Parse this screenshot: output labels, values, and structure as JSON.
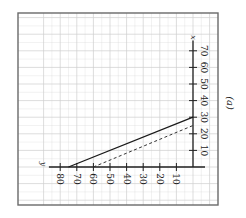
{
  "figure": {
    "panel_label": "(a)",
    "rotation_deg": 90,
    "colors": {
      "frame": "#6a6a6a",
      "grid": "#cfcfcf",
      "axis": "#222222",
      "solid_line": "#1a1a1a",
      "dashed_line": "#333333",
      "background": "#ffffff"
    }
  },
  "chart_data": {
    "type": "line",
    "title": "",
    "panel_label": "(a)",
    "xlabel": "x",
    "ylabel": "y",
    "orientation_note": "figure printed rotated 90 degrees clockwise; x axis runs up the page on the right, y axis runs left along the bottom",
    "xlim": [
      0,
      75
    ],
    "ylim": [
      0,
      85
    ],
    "x_ticks": [
      10,
      20,
      30,
      40,
      50,
      60,
      70
    ],
    "y_ticks": [
      10,
      20,
      30,
      40,
      50,
      60,
      70,
      80
    ],
    "grid": true,
    "legend": null,
    "series": [
      {
        "name": "solid",
        "style": "solid",
        "points": [
          {
            "x": 0,
            "y": 75
          },
          {
            "x": 30,
            "y": 0
          }
        ]
      },
      {
        "name": "dashed",
        "style": "dashed",
        "points": [
          {
            "x": 0,
            "y": 60
          },
          {
            "x": 25,
            "y": 0
          }
        ]
      }
    ]
  }
}
